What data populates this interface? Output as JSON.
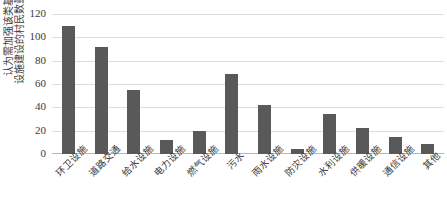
{
  "chart_data": {
    "type": "bar",
    "title": "",
    "subtitle": "",
    "xlabel": "",
    "ylabel": "认为需加强该类基础设施建设的村民数量(人)",
    "ylabel_lines": [
      "认为需加强该类基础",
      "设施建设的村民数量(人)"
    ],
    "categories": [
      "环卫设施",
      "道路交通",
      "给水设施",
      "电力设施",
      "燃气设施",
      "污水",
      "雨水设施",
      "防灾设施",
      "水利设施",
      "供暖设施",
      "通信设施",
      "其他"
    ],
    "values": [
      110,
      92,
      55,
      12,
      20,
      69,
      42,
      4,
      34,
      22,
      15,
      9
    ],
    "ylim": [
      0,
      120
    ],
    "yticks": [
      0,
      20,
      40,
      60,
      80,
      100,
      120
    ],
    "ytick_labels": [
      "0",
      "20",
      "40",
      "60",
      "80",
      "100",
      "120"
    ],
    "grid": true,
    "grid_axis": "y",
    "legend": false,
    "legend_position": "none",
    "bar_color": "#595959",
    "gridline_color": "#dcdcdc",
    "text_color": "#3a3a3a",
    "background_color": "#ffffff"
  }
}
